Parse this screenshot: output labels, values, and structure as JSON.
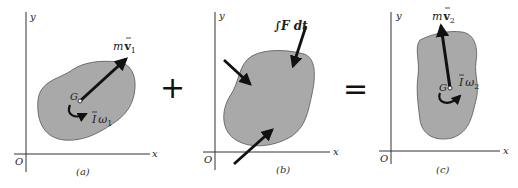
{
  "diagram": {
    "panels": [
      {
        "id": "a",
        "caption": "(a)",
        "axis_x": "x",
        "axis_y": "y",
        "origin": "O",
        "center_label": "G",
        "momentum_label_m": "m",
        "momentum_label_v": "v",
        "momentum_sub": "1",
        "angular_label_I": "I",
        "angular_label_w": "ω",
        "angular_sub": "1"
      },
      {
        "id": "b",
        "caption": "(b)",
        "axis_x": "x",
        "axis_y": "y",
        "origin": "O",
        "impulse_label": "∫F dt"
      },
      {
        "id": "c",
        "caption": "(c)",
        "axis_x": "x",
        "axis_y": "y",
        "origin": "O",
        "center_label": "G",
        "momentum_label_m": "m",
        "momentum_label_v": "v",
        "momentum_sub": "2",
        "angular_label_I": "I",
        "angular_label_w": "ω",
        "angular_sub": "2"
      }
    ],
    "operators": {
      "plus": "+",
      "equals": "="
    },
    "colors": {
      "body_fill": "#a9a9a9",
      "ink": "#111111"
    }
  }
}
